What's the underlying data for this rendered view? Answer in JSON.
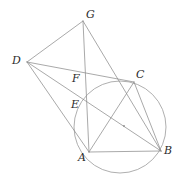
{
  "figure": {
    "type": "geometry-diagram",
    "width": 182,
    "height": 179,
    "background_color": "#ffffff",
    "stroke_color": "#8c8c8c",
    "label_color": "#2b2b2b",
    "points": {
      "G": {
        "label": "G",
        "x": 83,
        "y": 21,
        "label_x": 86,
        "label_y": 9
      },
      "D": {
        "label": "D",
        "x": 27,
        "y": 62,
        "label_x": 12,
        "label_y": 55
      },
      "C": {
        "label": "C",
        "x": 134,
        "y": 82,
        "label_x": 136,
        "label_y": 69
      },
      "F": {
        "label": "F",
        "x": 83,
        "y": 80,
        "label_x": 72,
        "label_y": 73
      },
      "E": {
        "label": "E",
        "x": 84,
        "y": 105,
        "label_x": 71,
        "label_y": 99
      },
      "A": {
        "label": "A",
        "x": 89,
        "y": 152,
        "label_x": 78,
        "label_y": 152
      },
      "B": {
        "label": "B",
        "x": 161,
        "y": 151,
        "label_x": 164,
        "label_y": 145
      },
      "O": {
        "label": "",
        "x": 124,
        "y": 126,
        "label_x": 124,
        "label_y": 126
      }
    },
    "circle": {
      "name": "circumcircle-ABC",
      "cx": 120,
      "cy": 127,
      "r": 46
    },
    "center_marker": {
      "name": "circle-center-dot",
      "cx": 124,
      "cy": 126,
      "r": 0.9
    },
    "segments": [
      {
        "name": "segment-D-G",
        "from": "D",
        "to": "G"
      },
      {
        "name": "segment-G-A",
        "from": "G",
        "to": "A"
      },
      {
        "name": "segment-G-B",
        "from": "G",
        "to": "B"
      },
      {
        "name": "segment-D-C",
        "from": "D",
        "to": "C"
      },
      {
        "name": "segment-D-B",
        "from": "D",
        "to": "B"
      },
      {
        "name": "segment-D-A",
        "from": "D",
        "to": "A"
      },
      {
        "name": "segment-A-C",
        "from": "A",
        "to": "C"
      },
      {
        "name": "segment-A-B",
        "from": "A",
        "to": "B"
      },
      {
        "name": "segment-C-B",
        "from": "C",
        "to": "B"
      }
    ],
    "label_order": [
      "G",
      "D",
      "C",
      "F",
      "E",
      "A",
      "B"
    ]
  }
}
